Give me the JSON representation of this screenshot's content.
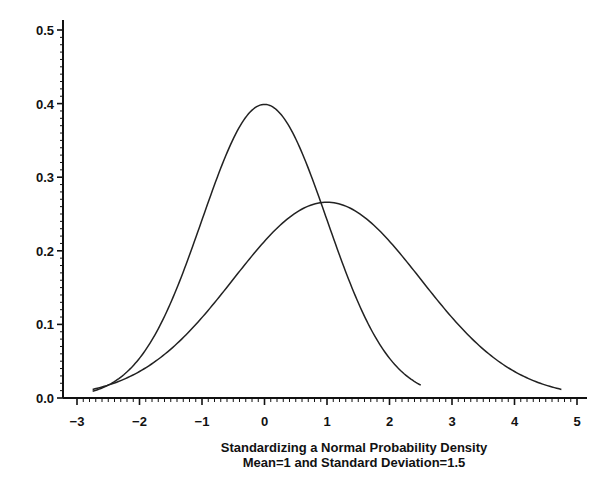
{
  "chart_data": {
    "type": "line",
    "title": "",
    "xlabel": "Standardizing a Normal Probability Density",
    "xlabel_line2": "Mean=1 and Standard Deviation=1.5",
    "ylabel": "",
    "xlim": [
      -3,
      5
    ],
    "ylim": [
      0,
      0.5
    ],
    "x_ticks": [
      -3,
      -2,
      -1,
      0,
      1,
      2,
      3,
      4,
      5
    ],
    "x_tick_labels": [
      "−3",
      "−2",
      "−1",
      "0",
      "1",
      "2",
      "3",
      "4",
      "5"
    ],
    "y_ticks": [
      0.0,
      0.1,
      0.2,
      0.3,
      0.4,
      0.5
    ],
    "y_tick_labels": [
      "0.0",
      "0.1",
      "0.2",
      "0.3",
      "0.4",
      "0.5"
    ],
    "x_minor_step": 0.1,
    "y_minor_step": 0.01,
    "grid": false,
    "legend": null,
    "series": [
      {
        "name": "Standard normal N(0,1)",
        "mean": 0,
        "sd": 1,
        "x_range": [
          -2.75,
          2.5
        ],
        "x": [
          -2.75,
          -2.5,
          -2,
          -1.5,
          -1,
          -0.5,
          0,
          0.5,
          1,
          1.5,
          2,
          2.5
        ],
        "values": [
          0.009,
          0.018,
          0.054,
          0.13,
          0.242,
          0.352,
          0.399,
          0.352,
          0.242,
          0.13,
          0.054,
          0.018
        ]
      },
      {
        "name": "Normal N(1, 1.5)",
        "mean": 1,
        "sd": 1.5,
        "x_range": [
          -2.75,
          4.75
        ],
        "x": [
          -2.75,
          -2,
          -1,
          0,
          1,
          2,
          3,
          4,
          4.75
        ],
        "values": [
          0.012,
          0.036,
          0.109,
          0.213,
          0.266,
          0.213,
          0.109,
          0.036,
          0.012
        ]
      }
    ]
  }
}
